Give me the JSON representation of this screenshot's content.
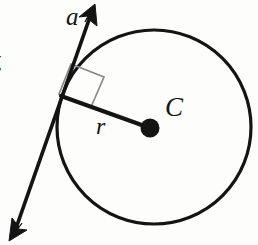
{
  "figure": {
    "name": "circle-tangent-radius-diagram",
    "description_labels": {
      "tangent_line_label": "a",
      "radius_label": "r",
      "center_label": "C",
      "margin_clipped_text": "⁄."
    },
    "colors": {
      "stroke": "#141414",
      "right_angle_marker": "#8a8a8a",
      "background": "#fdfdfc",
      "center_dot": "#141414"
    },
    "geometry": {
      "circle": {
        "cx": 154,
        "cy": 127,
        "r": 97,
        "stroke_width": 3.2
      },
      "center_dot": {
        "cx": 150,
        "cy": 128,
        "r": 9
      },
      "tangent_point": {
        "x": 62,
        "y": 97
      },
      "tangent_line": {
        "x1": 93,
        "y1": 10,
        "x2": 13,
        "y2": 236,
        "stroke_width": 3.6,
        "arrow_start": true,
        "arrow_end": true
      },
      "radius_line": {
        "x1": 62,
        "y1": 97,
        "x2": 150,
        "y2": 128,
        "stroke_width": 4.0
      },
      "right_angle_marker": {
        "points": "70,63 104,76 92,108 60,95",
        "stroke_width": 1.6
      }
    }
  }
}
